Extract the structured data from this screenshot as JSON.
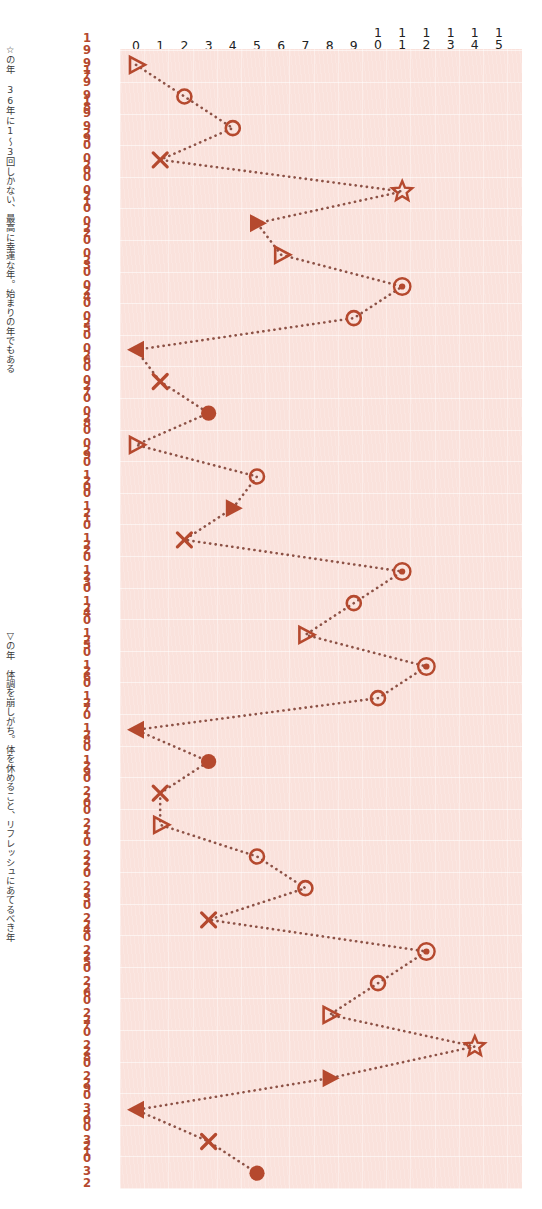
{
  "chart_data": {
    "type": "line",
    "title": "",
    "subtitle": "",
    "xlabel": "",
    "ylabel": "",
    "xlim": [
      0,
      15
    ],
    "ylim": [
      1997,
      2032
    ],
    "grid": true,
    "legend_position": "left-vertical",
    "orientation": "horizontal-value-vertical-year",
    "x_ticks": [
      "0",
      "1",
      "2",
      "3",
      "4",
      "5",
      "6",
      "7",
      "8",
      "9",
      "10",
      "11",
      "12",
      "13",
      "14",
      "15"
    ],
    "categories": [
      "1997",
      "1998",
      "1999",
      "2000",
      "2001",
      "2002",
      "2003",
      "2004",
      "2005",
      "2006",
      "2007",
      "2008",
      "2009",
      "2010",
      "2011",
      "2012",
      "2013",
      "2014",
      "2015",
      "2016",
      "2017",
      "2018",
      "2019",
      "2020",
      "2021",
      "2022",
      "2023",
      "2024",
      "2025",
      "2026",
      "2027",
      "2028",
      "2029",
      "2030",
      "2031",
      "2032"
    ],
    "values": [
      0,
      2,
      4,
      1,
      11,
      5,
      6,
      11,
      9,
      0,
      1,
      3,
      0,
      5,
      4,
      2,
      11,
      9,
      7,
      12,
      10,
      0,
      3,
      1,
      1,
      5,
      7,
      3,
      12,
      10,
      8,
      14,
      8,
      0,
      3,
      5
    ],
    "markers": [
      "open-triangle-right",
      "open-circle",
      "open-circle",
      "cross",
      "star",
      "filled-triangle-right",
      "open-triangle-right",
      "double-circle",
      "open-circle",
      "filled-triangle-left",
      "cross",
      "filled-circle",
      "open-triangle-right",
      "open-circle",
      "filled-triangle-right",
      "cross",
      "double-circle",
      "open-circle",
      "open-triangle-right",
      "double-circle",
      "open-circle",
      "filled-triangle-left",
      "filled-circle",
      "cross",
      "open-triangle-right",
      "open-circle",
      "open-circle",
      "cross",
      "double-circle",
      "open-circle",
      "open-triangle-right",
      "star",
      "filled-triangle-right",
      "filled-triangle-left",
      "cross",
      "filled-circle"
    ],
    "series": [
      {
        "name": "運気",
        "values": [
          0,
          2,
          4,
          1,
          11,
          5,
          6,
          11,
          9,
          0,
          1,
          3,
          0,
          5,
          4,
          2,
          11,
          9,
          7,
          12,
          10,
          0,
          3,
          1,
          1,
          5,
          7,
          3,
          12,
          10,
          8,
          14,
          8,
          0,
          3,
          5
        ]
      }
    ],
    "annotations": [
      {
        "id": "star-year",
        "marker": "☆",
        "text": "☆の年　36年に1〜3回しかない、最高に幸運な年。始まりの年でもある"
      },
      {
        "id": "triangle-year",
        "marker": "▽",
        "text": "▽の年　体調を崩しがち。体を休めること、リフレッシュにあてるべき年"
      }
    ],
    "colors": {
      "plot_background": "#fae2dc",
      "marker": "#b5492e",
      "line": "#8d5246",
      "year_label": "#b5492e",
      "x_tick_label": "#222222",
      "caption": "#3a3a3a"
    }
  }
}
